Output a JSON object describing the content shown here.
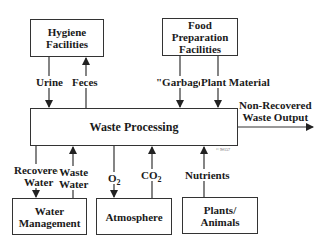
{
  "diagram": {
    "nodes": {
      "hygiene": {
        "line1": "Hygiene",
        "line2": "Facilities"
      },
      "food": {
        "line1": "Food",
        "line2": "Preparation",
        "line3": "Facilities"
      },
      "waste_processing": {
        "label": "Waste Processing"
      },
      "water_management": {
        "line1": "Water",
        "line2": "Management"
      },
      "atmosphere": {
        "label": "Atmosphere"
      },
      "plants_animals": {
        "line1": "Plants/",
        "line2": "Animals"
      }
    },
    "edges": {
      "urine": {
        "label": "Urine",
        "from": "Hygiene Facilities",
        "to": "Waste Processing"
      },
      "feces": {
        "label": "Feces",
        "from": "Waste Processing",
        "to": "Hygiene Facilities"
      },
      "garbage": {
        "label": "\"Garbage\"",
        "from": "Food Preparation Facilities",
        "to": "Waste Processing"
      },
      "plant_material": {
        "label": "Plant Material",
        "from": "Food Preparation Facilities",
        "to": "Waste Processing"
      },
      "non_recovered": {
        "line1": "Non-Recovered",
        "line2": "Waste Output",
        "from": "Waste Processing",
        "to": "output"
      },
      "recovered_water": {
        "line1": "Recovered",
        "line2": "Water",
        "from": "Waste Processing",
        "to": "Water Management"
      },
      "waste_water": {
        "line1": "Waste",
        "line2": "Water",
        "from": "Water Management",
        "to": "Waste Processing"
      },
      "o2": {
        "base": "O",
        "sub": "2",
        "from": "Waste Processing",
        "to": "Atmosphere"
      },
      "co2": {
        "base": "CO",
        "sub": "2",
        "from": "Atmosphere",
        "to": "Waste Processing"
      },
      "nutrients": {
        "label": "Nutrients",
        "from": "Plants/Animals",
        "to": "Waste Processing"
      }
    },
    "copyright": "© 9#157"
  }
}
